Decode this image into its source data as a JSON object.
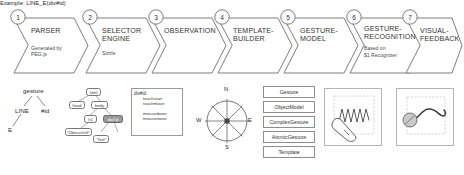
{
  "pipeline": {
    "steps": [
      {
        "num": "1",
        "title": "PARSER",
        "sub": "Generated by\nPEG.js"
      },
      {
        "num": "2",
        "title": "SELECTOR\nENGINE",
        "sub": "Sizzle"
      },
      {
        "num": "3",
        "title": "OBSERVATION",
        "sub": ""
      },
      {
        "num": "4",
        "title": "TEMPLATE-\nBUILDER",
        "sub": ""
      },
      {
        "num": "5",
        "title": "GESTURE-\nMODEL",
        "sub": ""
      },
      {
        "num": "6",
        "title": "GESTURE-\nRECOGNITION",
        "sub": "Based on\n$1 Recognizer"
      },
      {
        "num": "7",
        "title": "VISUAL-\nFEEDBACK",
        "sub": ""
      }
    ]
  },
  "parse_tree": {
    "root": "gesture",
    "left_child": "LINE",
    "right_child": "#id",
    "leaf": "E"
  },
  "dom_tree": {
    "nodes": [
      {
        "label": "html"
      },
      {
        "label": "head"
      },
      {
        "label": "body"
      },
      {
        "label": "h1"
      },
      {
        "label": "div#id"
      },
      {
        "label": "\"Überschrift\""
      },
      {
        "label": "\"Text\""
      }
    ],
    "selected": "div#id"
  },
  "event_box": {
    "target": "div#id",
    "events": [
      "touchstart",
      "touchmove",
      "mousedown",
      "mousemove"
    ]
  },
  "compass": {
    "directions": [
      "N",
      "E",
      "S",
      "W"
    ]
  },
  "class_list": {
    "items": [
      "Gesture",
      "ObjectModel",
      "ComplexGesture",
      "AtomicGesture",
      "Template"
    ]
  },
  "example": {
    "text": "Example: LINE_E(div#id)"
  },
  "colors": {
    "outline": "#6f6f6f",
    "text": "#2b2b2b",
    "selected_node": "#9a9a9a"
  }
}
